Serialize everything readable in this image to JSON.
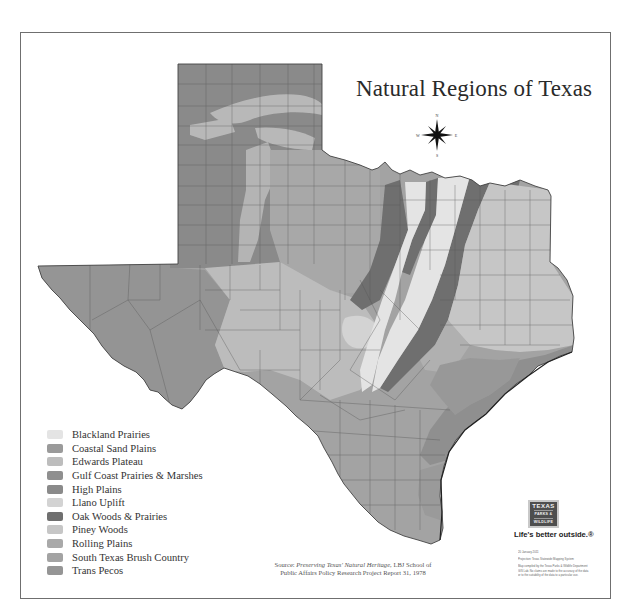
{
  "title": "Natural Regions of Texas",
  "compass": {
    "north": "N",
    "south": "S",
    "east": "E",
    "west": "W"
  },
  "legend": {
    "items": [
      {
        "label": "Blackland Prairies",
        "color": "#e4e4e4"
      },
      {
        "label": "Coastal Sand Plains",
        "color": "#9a9a9a"
      },
      {
        "label": "Edwards Plateau",
        "color": "#bdbdbd"
      },
      {
        "label": "Gulf Coast Prairies & Marshes",
        "color": "#8f8f8f"
      },
      {
        "label": "High Plains",
        "color": "#8a8a8a"
      },
      {
        "label": "Llano Uplift",
        "color": "#d3d3d3"
      },
      {
        "label": "Oak Woods & Prairies",
        "color": "#6f6f6f"
      },
      {
        "label": "Piney Woods",
        "color": "#c6c6c6"
      },
      {
        "label": "Rolling Plains",
        "color": "#a9a9a9"
      },
      {
        "label": "South Texas Brush Country",
        "color": "#a3a3a3"
      },
      {
        "label": "Trans Pecos",
        "color": "#959595"
      }
    ]
  },
  "source": {
    "prefix": "Source: ",
    "title": "Preserving Texas' Natural Heritage",
    "line1_suffix": ", LBJ School of",
    "line2": "Public Affairs Policy Research Project Report 31, 1978"
  },
  "logo": {
    "line1": "TEXAS",
    "line2": "PARKS &",
    "line3": "WILDLIFE",
    "tagline": "Life's better outside.®"
  },
  "fine_print": {
    "date": "20 January 2011",
    "projection": "Projection: Texas Statewide Mapping System",
    "disclaimer1": "Map compiled by the Texas Parks & Wildlife Department",
    "disclaimer2": "GIS Lab. No claims are made to the accuracy of the data",
    "disclaimer3": "or to the suitability of the data to a particular use."
  },
  "counties": {
    "panhandle": [
      "DALLAM",
      "SHERMAN",
      "HANSFORD",
      "OCHILTREE",
      "LIPSCOMB",
      "HARTLEY",
      "MOORE",
      "HUTCHINSON",
      "ROBERTS",
      "HEMPHILL",
      "OLDHAM",
      "POTTER",
      "CARSON",
      "GRAY",
      "WHEELER",
      "DEAF SMITH",
      "RANDALL",
      "ARMSTRONG",
      "DONLEY",
      "COLLINGSWORTH",
      "PARMER",
      "CASTRO",
      "SWISHER",
      "BRISCOE",
      "HALL",
      "CHILDRESS",
      "BAILEY",
      "LAMB",
      "HALE",
      "FLOYD",
      "MOTLEY",
      "COTTLE",
      "HARDEMAN",
      "FOARD",
      "WILBARGER",
      "WICHITA",
      "COCHRAN",
      "HOCKLEY",
      "LUBBOCK",
      "CROSBY",
      "DICKENS",
      "KING",
      "KNOX",
      "BAYLOR",
      "ARCHER",
      "CLAY",
      "YOAKUM",
      "TERRY",
      "LYNN",
      "GARZA",
      "KENT",
      "STONEWALL",
      "HASKELL",
      "THROCKMORTON",
      "YOUNG",
      "JACK",
      "GAINES",
      "DAWSON",
      "BORDEN",
      "SCURRY",
      "FISHER",
      "JONES",
      "SHACKELFORD",
      "STEPHENS",
      "PALO PINTO",
      "ANDREWS",
      "MARTIN",
      "HOWARD",
      "MITCHELL",
      "NOLAN",
      "TAYLOR",
      "CALLAHAN",
      "EASTLAND"
    ],
    "west": [
      "EL PASO",
      "HUDSPETH",
      "CULBERSON",
      "REEVES",
      "LOVING",
      "WINKLER",
      "ECTOR",
      "MIDLAND",
      "GLASSCOCK",
      "WARD",
      "CRANE",
      "UPTON",
      "REAGAN",
      "JEFF DAVIS",
      "PECOS",
      "PRESIDIO",
      "BREWSTER",
      "TERRELL",
      "CROCKETT",
      "SUTTON",
      "VAL VERDE",
      "STERLING",
      "COKE",
      "RUNNELS",
      "COLEMAN",
      "BROWN",
      "TOM GREEN",
      "IRION",
      "SCHLEICHER",
      "CONCHO",
      "MCCULLOCH",
      "SAN SABA",
      "MENARD",
      "KIMBLE",
      "MASON",
      "LLANO",
      "BURNET"
    ],
    "central": [
      "EDWARDS",
      "REAL",
      "KERR",
      "GILLESPIE",
      "BLANCO",
      "HAYS",
      "TRAVIS",
      "WILLIAMSON",
      "BANDERA",
      "KENDALL",
      "COMAL",
      "BEXAR",
      "GUADALUPE",
      "CALDWELL",
      "BASTROP",
      "LEE",
      "BURLESON",
      "MILAM",
      "BELL",
      "CORYELL",
      "HAMILTON",
      "MILLS",
      "LAMPASAS",
      "BOSQUE",
      "HILL",
      "MCLENNAN",
      "FALLS",
      "ROBERTSON",
      "LIMESTONE",
      "NAVARRO",
      "ELLIS",
      "JOHNSON",
      "HOOD",
      "ERATH",
      "COMANCHE",
      "SOMERVELL",
      "PARKER",
      "TARRANT",
      "DALLAS",
      "WISE",
      "DENTON",
      "COLLIN",
      "COOKE",
      "GRAYSON",
      "FANNIN",
      "HUNT",
      "ROCKWALL",
      "KAUFMAN",
      "VAN ZANDT",
      "HENDERSON",
      "FREESTONE",
      "LEON",
      "MADISON",
      "BRAZOS",
      "GRIMES",
      "WASHINGTON",
      "FAYETTE",
      "AUSTIN",
      "COLORADO",
      "WALLER",
      "MONTGOMERY"
    ],
    "east": [
      "LAMAR",
      "RED RIVER",
      "BOWIE",
      "DELTA",
      "HOPKINS",
      "FRANKLIN",
      "TITUS",
      "MORRIS",
      "CASS",
      "RAINS",
      "WOOD",
      "CAMP",
      "UPSHUR",
      "MARION",
      "SMITH",
      "GREGG",
      "HARRISON",
      "CHEROKEE",
      "RUSK",
      "PANOLA",
      "ANDERSON",
      "NACOGDOCHES",
      "SHELBY",
      "HOUSTON",
      "ANGELINA",
      "SAN AUGUSTINE",
      "SABINE",
      "TRINITY",
      "POLK",
      "TYLER",
      "JASPER",
      "NEWTON",
      "WALKER",
      "SAN JACINTO",
      "HARDIN",
      "LIBERTY",
      "ORANGE",
      "JEFFERSON",
      "CHAMBERS",
      "HARRIS",
      "FORT BEND",
      "GALVESTON",
      "BRAZORIA",
      "WHARTON",
      "MATAGORDA",
      "JACKSON",
      "CALHOUN",
      "VICTORIA"
    ],
    "south": [
      "KINNEY",
      "UVALDE",
      "MEDINA",
      "MAVERICK",
      "ZAVALA",
      "FRIO",
      "ATASCOSA",
      "WILSON",
      "KARNES",
      "GONZALES",
      "DEWITT",
      "LAVACA",
      "DIMMIT",
      "LA SALLE",
      "MCMULLEN",
      "LIVE OAK",
      "BEE",
      "GOLIAD",
      "REFUGIO",
      "ARANSAS",
      "SAN PATRICIO",
      "NUECES",
      "WEBB",
      "DUVAL",
      "JIM WELLS",
      "KLEBERG",
      "ZAPATA",
      "JIM HOGG",
      "BROOKS",
      "KENEDY",
      "STARR",
      "HIDALGO",
      "WILLACY",
      "CAMERON"
    ]
  }
}
